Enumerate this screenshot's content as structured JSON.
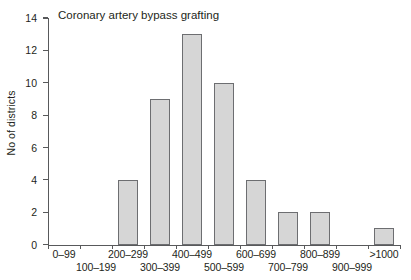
{
  "chart_data": {
    "type": "bar",
    "title": "Coronary artery bypass grafting",
    "xlabel": "",
    "ylabel": "No of districts",
    "categories": [
      "0–99",
      "100–199",
      "200–299",
      "300–399",
      "400–499",
      "500–599",
      "600–699",
      "700–799",
      "800–899",
      "900–999",
      ">1000"
    ],
    "values": [
      0,
      0,
      4,
      9,
      13,
      10,
      4,
      2,
      2,
      0,
      1
    ],
    "ylim": [
      0,
      14
    ],
    "yticks": [
      0,
      2,
      4,
      6,
      8,
      10,
      12,
      14
    ],
    "ytick_labels": [
      "0",
      "2",
      "4",
      "6",
      "8",
      "10",
      "12",
      "14"
    ],
    "grid": false,
    "legend": null,
    "bar_fill_color": "#d6d6d6",
    "bar_border_color": "#6d6e71",
    "axis_color": "#58595b",
    "text_color": "#231f20",
    "background_color": "#ffffff",
    "label_layout": "staggered-two-rows"
  }
}
